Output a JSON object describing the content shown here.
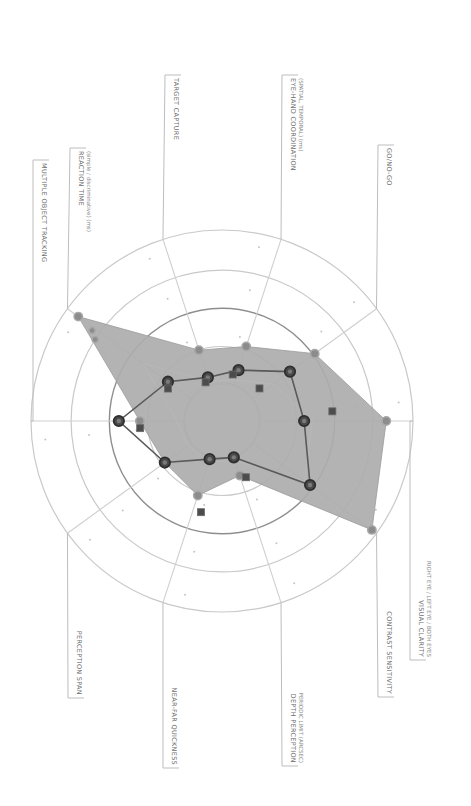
{
  "chart_data": {
    "type": "radar",
    "title": "",
    "orientation": "rotated 90 degrees clockwise (labels read top-to-bottom)",
    "axes": [
      {
        "label": "VISUAL CLARITY",
        "sublabel": "RIGHT EYE / LEFT EYE / BOTH EYES",
        "angle_deg": 0
      },
      {
        "label": "GO/NO-GO",
        "sublabel": "",
        "angle_deg": 36
      },
      {
        "label": "EYE-HAND COORDINATION",
        "sublabel": "(SPATIAL, TEMPORAL) (ms)",
        "angle_deg": 72
      },
      {
        "label": "TARGET CAPTURE",
        "sublabel": "",
        "angle_deg": 108
      },
      {
        "label": "REACTION TIME",
        "sublabel": "(simple / discriminative) (ms)",
        "angle_deg": 144
      },
      {
        "label": "MULTIPLE OBJECT TRACKING",
        "sublabel": "",
        "angle_deg": 180
      },
      {
        "label": "PERCEPTION SPAN",
        "sublabel": "",
        "angle_deg": 216
      },
      {
        "label": "NEAR-FAR QUICKNESS",
        "sublabel": "",
        "angle_deg": 252
      },
      {
        "label": "DEPTH PERCEPTION",
        "sublabel": "PERIODIC LIMIT (ARCSEC)",
        "angle_deg": 288
      },
      {
        "label": "CONTRAST SENSITIVITY",
        "sublabel": "",
        "angle_deg": 324
      }
    ],
    "categories": [
      "VISUAL CLARITY",
      "GO/NO-GO",
      "EYE-HAND COORDINATION",
      "TARGET CAPTURE",
      "REACTION TIME",
      "MULTIPLE OBJECT TRACKING",
      "PERCEPTION SPAN",
      "NEAR-FAR QUICKNESS",
      "DEPTH PERCEPTION",
      "CONTRAST SENSITIVITY"
    ],
    "rlim": [
      0,
      1
    ],
    "rings": [
      0.2,
      0.39,
      0.59,
      0.79,
      1.0
    ],
    "emphasized_ring": 0.59,
    "series": [
      {
        "name": "Group range (shaded)",
        "style": "area",
        "values": [
          0.86,
          0.6,
          0.41,
          0.39,
          0.93,
          0.43,
          0.37,
          0.41,
          0.3,
          0.97
        ]
      },
      {
        "name": "Individual (dark line)",
        "style": "line",
        "values": [
          0.43,
          0.44,
          0.28,
          0.24,
          0.35,
          0.54,
          0.37,
          0.21,
          0.2,
          0.57
        ]
      },
      {
        "name": "Comparison (squares)",
        "style": "markers",
        "values": [
          0.58,
          0.26,
          0.25,
          0.22,
          0.33,
          0.43,
          null,
          0.49,
          0.32,
          null
        ]
      }
    ],
    "extra_points": [
      {
        "series": "Group range (shaded)",
        "angle_deg": 144,
        "r": 0.86
      },
      {
        "series": "Group range (shaded)",
        "angle_deg": 146,
        "r": 0.82
      }
    ],
    "grid": true,
    "legend": null
  },
  "colors": {
    "area_fill": "#adadad",
    "area_marker": "#8c8c8c",
    "line": "#5a5a5a",
    "line_marker": "#3a3a3a",
    "square_marker": "#4c4c4c",
    "grid": "#c9c9c9"
  },
  "layout": {
    "center": [
      222,
      421
    ],
    "radius": 191,
    "hole_radius": 37
  },
  "leaders": [
    {
      "axis": 0,
      "x": 410,
      "y_text_start": 660,
      "y_end": 520,
      "side": "bottom"
    },
    {
      "axis": 1,
      "x": 378,
      "y_text_start": 145,
      "y_end": 310,
      "side": "top"
    },
    {
      "axis": 2,
      "x": 282,
      "y_text_start": 75,
      "y_end": 240,
      "side": "top"
    },
    {
      "axis": 3,
      "x": 165,
      "y_text_start": 75,
      "y_end": 240,
      "side": "top"
    },
    {
      "axis": 4,
      "x": 70,
      "y_text_start": 148,
      "y_end": 310,
      "side": "top"
    },
    {
      "axis": 5,
      "x": 33,
      "y_text_start": 160,
      "y_end": 421,
      "side": "top"
    },
    {
      "axis": 6,
      "x": 68,
      "y_text_start": 698,
      "y_end": 533,
      "side": "bottom"
    },
    {
      "axis": 7,
      "x": 163,
      "y_text_start": 768,
      "y_end": 602,
      "side": "bottom"
    },
    {
      "axis": 8,
      "x": 282,
      "y_text_start": 766,
      "y_end": 602,
      "side": "bottom"
    },
    {
      "axis": 9,
      "x": 378,
      "y_text_start": 697,
      "y_end": 533,
      "side": "bottom"
    }
  ]
}
